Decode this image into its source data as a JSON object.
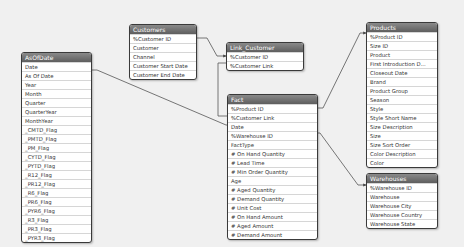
{
  "diagram": {
    "type": "data-model",
    "tables": {
      "asofdate": {
        "title": "AsOfDate",
        "fields": [
          "Date",
          "As Of Date",
          "Year",
          "Month",
          "Quarter",
          "QuarterYear",
          "MonthYear",
          "_CMTD_Flag",
          "_PMTD_Flag",
          "_PM_Flag",
          "_CYTD_Flag",
          "_PYTD_Flag",
          "_R12_Flag",
          "_PR12_Flag",
          "_R6_Flag",
          "_PR6_Flag",
          "_PYR6_Flag",
          "_R3_Flag",
          "_PR3_Flag",
          "_PYR3_Flag"
        ]
      },
      "customers": {
        "title": "Customers",
        "fields": [
          "%Customer ID",
          "Customer",
          "Channel",
          "Customer Start Date",
          "Customer End Date"
        ]
      },
      "link_customer": {
        "title": "Link_Customer",
        "fields": [
          "%Customer ID",
          "%Customer Link"
        ]
      },
      "fact": {
        "title": "Fact",
        "fields": [
          "%Product ID",
          "%Customer Link",
          "Date",
          "%Warehouse ID",
          "FactType",
          "# On Hand Quantity",
          "# Lead Time",
          "# Min Order Quantity",
          "Age",
          "# Aged Quantity",
          "# Demand Quantity",
          "# Unit Cost",
          "# On Hand Amount",
          "# Aged Amount",
          "# Demand Amount"
        ]
      },
      "products": {
        "title": "Products",
        "fields": [
          "%Product ID",
          "Size ID",
          "Product",
          "First Introduction D...",
          "Closeout Date",
          "Brand",
          "Product Group",
          "Season",
          "Style",
          "Style Short Name",
          "Size Description",
          "Size",
          "Size Sort Order",
          "Color Description",
          "Color"
        ]
      },
      "warehouses": {
        "title": "Warehouses",
        "fields": [
          "%Warehouse ID",
          "Warehouse",
          "Warehouse City",
          "Warehouse Country",
          "Warehouse State"
        ]
      }
    },
    "links": [
      {
        "from": "asofdate.Date",
        "to": "fact.Date"
      },
      {
        "from": "customers.%Customer ID",
        "to": "link_customer.%Customer ID"
      },
      {
        "from": "link_customer.%Customer Link",
        "to": "fact.%Customer Link"
      },
      {
        "from": "fact.%Product ID",
        "to": "products.%Product ID"
      },
      {
        "from": "fact.%Warehouse ID",
        "to": "warehouses.%Warehouse ID"
      }
    ],
    "colors": {
      "background": "#f0f0f0",
      "header": "#6e6e6e",
      "border": "#3a3a3a",
      "link": "#555555"
    }
  }
}
